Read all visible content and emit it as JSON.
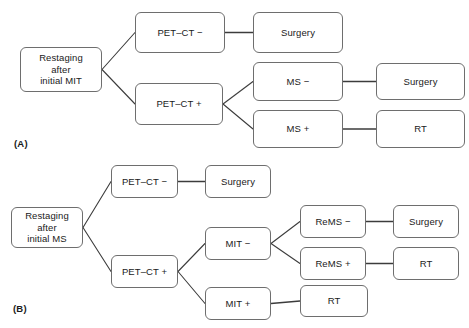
{
  "figure": {
    "type": "flowchart",
    "panels": [
      {
        "id": "A",
        "label": "(A)",
        "nodes": [
          {
            "id": "a-root",
            "text": "Restaging\nafter\ninitial MIT",
            "x": 20,
            "y": 47,
            "w": 82,
            "h": 45
          },
          {
            "id": "a-petct-neg",
            "text": "PET–CT −",
            "x": 135,
            "y": 12,
            "w": 90,
            "h": 41
          },
          {
            "id": "a-surgery-1",
            "text": "Surgery",
            "x": 253,
            "y": 12,
            "w": 90,
            "h": 41
          },
          {
            "id": "a-petct-pos",
            "text": "PET–CT +",
            "x": 135,
            "y": 83,
            "w": 88,
            "h": 42
          },
          {
            "id": "a-ms-neg",
            "text": "MS −",
            "x": 253,
            "y": 62,
            "w": 90,
            "h": 39
          },
          {
            "id": "a-ms-pos",
            "text": "MS +",
            "x": 253,
            "y": 110,
            "w": 90,
            "h": 38
          },
          {
            "id": "a-surgery-2",
            "text": "Surgery",
            "x": 376,
            "y": 63,
            "w": 89,
            "h": 37
          },
          {
            "id": "a-rt-1",
            "text": "RT",
            "x": 376,
            "y": 110,
            "w": 89,
            "h": 38
          }
        ],
        "edges": [
          {
            "from": "a-root",
            "to": "a-petct-neg",
            "kind": "branch"
          },
          {
            "from": "a-root",
            "to": "a-petct-pos",
            "kind": "branch"
          },
          {
            "from": "a-petct-neg",
            "to": "a-surgery-1",
            "kind": "straight"
          },
          {
            "from": "a-petct-pos",
            "to": "a-ms-neg",
            "kind": "branch"
          },
          {
            "from": "a-petct-pos",
            "to": "a-ms-pos",
            "kind": "branch"
          },
          {
            "from": "a-ms-neg",
            "to": "a-surgery-2",
            "kind": "straight"
          },
          {
            "from": "a-ms-pos",
            "to": "a-rt-1",
            "kind": "straight"
          }
        ],
        "label_pos": {
          "x": 14,
          "y": 138
        }
      },
      {
        "id": "B",
        "label": "(B)",
        "nodes": [
          {
            "id": "b-root",
            "text": "Restaging\nafter\ninitial MS",
            "x": 11,
            "y": 207,
            "w": 72,
            "h": 41
          },
          {
            "id": "b-petct-neg",
            "text": "PET–CT −",
            "x": 111,
            "y": 165,
            "w": 67,
            "h": 33
          },
          {
            "id": "b-surgery-1",
            "text": "Surgery",
            "x": 205,
            "y": 165,
            "w": 66,
            "h": 33
          },
          {
            "id": "b-petct-pos",
            "text": "PET–CT +",
            "x": 111,
            "y": 255,
            "w": 67,
            "h": 33
          },
          {
            "id": "b-mit-neg",
            "text": "MIT −",
            "x": 205,
            "y": 227,
            "w": 66,
            "h": 33
          },
          {
            "id": "b-mit-pos",
            "text": "MIT +",
            "x": 205,
            "y": 287,
            "w": 66,
            "h": 33
          },
          {
            "id": "b-rems-neg",
            "text": "ReMS −",
            "x": 300,
            "y": 205,
            "w": 66,
            "h": 33
          },
          {
            "id": "b-rems-pos",
            "text": "ReMS +",
            "x": 300,
            "y": 247,
            "w": 66,
            "h": 33
          },
          {
            "id": "b-rt-2",
            "text": "RT",
            "x": 300,
            "y": 285,
            "w": 68,
            "h": 32
          },
          {
            "id": "b-surgery-2",
            "text": "Surgery",
            "x": 393,
            "y": 205,
            "w": 66,
            "h": 33
          },
          {
            "id": "b-rt-1",
            "text": "RT",
            "x": 393,
            "y": 247,
            "w": 66,
            "h": 33
          }
        ],
        "edges": [
          {
            "from": "b-root",
            "to": "b-petct-neg",
            "kind": "branch"
          },
          {
            "from": "b-root",
            "to": "b-petct-pos",
            "kind": "branch"
          },
          {
            "from": "b-petct-neg",
            "to": "b-surgery-1",
            "kind": "straight"
          },
          {
            "from": "b-petct-pos",
            "to": "b-mit-neg",
            "kind": "branch"
          },
          {
            "from": "b-petct-pos",
            "to": "b-mit-pos",
            "kind": "branch"
          },
          {
            "from": "b-mit-neg",
            "to": "b-rems-neg",
            "kind": "branch"
          },
          {
            "from": "b-mit-neg",
            "to": "b-rems-pos",
            "kind": "branch"
          },
          {
            "from": "b-mit-pos",
            "to": "b-rt-2",
            "kind": "straight"
          },
          {
            "from": "b-rems-neg",
            "to": "b-surgery-2",
            "kind": "straight"
          },
          {
            "from": "b-rems-pos",
            "to": "b-rt-1",
            "kind": "straight"
          }
        ],
        "label_pos": {
          "x": 13,
          "y": 303
        }
      }
    ],
    "colors": {
      "node_border": "#6e6e6e",
      "node_fill": "#ffffff",
      "edge": "#3c3c3c",
      "text": "#1a1a1a",
      "background": "#ffffff"
    }
  }
}
